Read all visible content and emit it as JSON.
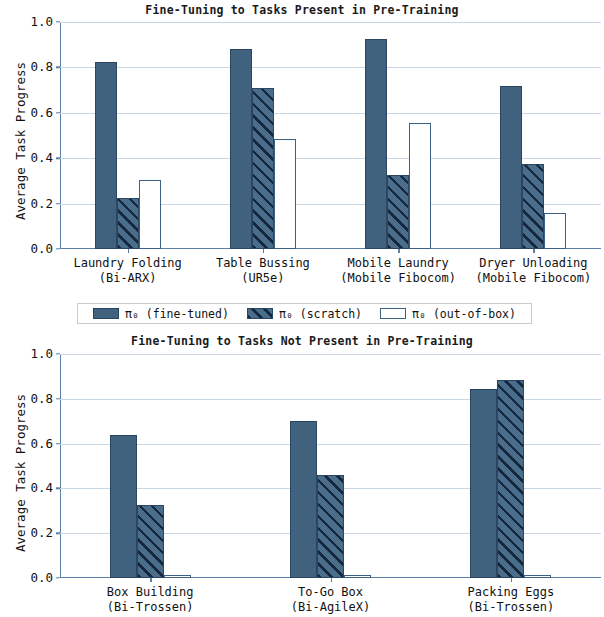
{
  "figure": {
    "ylabel": "Average Task Progress",
    "ytick_labels": [
      "0.0",
      "0.2",
      "0.4",
      "0.6",
      "0.8",
      "1.0"
    ],
    "colors": {
      "fine_tuned_fill": "#41627f",
      "scratch_stripe": "#16283d",
      "scratch_fill": "#4b6d8c",
      "out_of_box_edge": "#3d6185",
      "grid": "#c9d6e4",
      "axis": "#5b7fa6"
    }
  },
  "legend": {
    "items": [
      {
        "label_prefix": "π",
        "label_sub": "0",
        "label_suffix": " (fine-tuned)",
        "style": "solid",
        "full": "π₀ (fine-tuned)"
      },
      {
        "label_prefix": "π",
        "label_sub": "0",
        "label_suffix": " (scratch)",
        "style": "hatch",
        "full": "π₀ (scratch)"
      },
      {
        "label_prefix": "π",
        "label_sub": "0",
        "label_suffix": " (out-of-box)",
        "style": "open",
        "full": "π₀ (out-of-box)"
      }
    ]
  },
  "chart_data": [
    {
      "type": "bar",
      "title": "Fine-Tuning to Tasks Present in Pre-Training",
      "xlabel": "",
      "ylabel": "Average Task Progress",
      "ylim": [
        0.0,
        1.0
      ],
      "yticks": [
        0.0,
        0.2,
        0.4,
        0.6,
        0.8,
        1.0
      ],
      "grid": true,
      "legend_position": "below",
      "categories": [
        "Laundry Folding\n(Bi-ARX)",
        "Table Bussing\n(UR5e)",
        "Mobile Laundry\n(Mobile Fibocom)",
        "Dryer Unloading\n(Mobile Fibocom)"
      ],
      "category_lines": [
        [
          "Laundry Folding",
          "(Bi-ARX)"
        ],
        [
          "Table Bussing",
          "(UR5e)"
        ],
        [
          "Mobile Laundry",
          "(Mobile Fibocom)"
        ],
        [
          "Dryer Unloading",
          "(Mobile Fibocom)"
        ]
      ],
      "series": [
        {
          "name": "π₀ (fine-tuned)",
          "style": "solid",
          "values": [
            0.825,
            0.88,
            0.925,
            0.72
          ]
        },
        {
          "name": "π₀ (scratch)",
          "style": "hatch",
          "values": [
            0.225,
            0.71,
            0.325,
            0.375
          ]
        },
        {
          "name": "π₀ (out-of-box)",
          "style": "open",
          "values": [
            0.303,
            0.485,
            0.555,
            0.16
          ]
        }
      ]
    },
    {
      "type": "bar",
      "title": "Fine-Tuning to Tasks Not Present in Pre-Training",
      "xlabel": "",
      "ylabel": "Average Task Progress",
      "ylim": [
        0.0,
        1.0
      ],
      "yticks": [
        0.0,
        0.2,
        0.4,
        0.6,
        0.8,
        1.0
      ],
      "grid": true,
      "legend_position": "shared-above",
      "categories": [
        "Box Building\n(Bi-Trossen)",
        "To-Go Box\n(Bi-AgileX)",
        "Packing Eggs\n(Bi-Trossen)"
      ],
      "category_lines": [
        [
          "Box Building",
          "(Bi-Trossen)"
        ],
        [
          "To-Go Box",
          "(Bi-AgileX)"
        ],
        [
          "Packing Eggs",
          "(Bi-Trossen)"
        ]
      ],
      "series": [
        {
          "name": "π₀ (fine-tuned)",
          "style": "solid",
          "values": [
            0.64,
            0.7,
            0.845
          ]
        },
        {
          "name": "π₀ (scratch)",
          "style": "hatch",
          "values": [
            0.325,
            0.46,
            0.885
          ]
        },
        {
          "name": "π₀ (out-of-box)",
          "style": "open",
          "values": [
            0.0,
            0.0,
            0.0
          ]
        }
      ]
    }
  ]
}
